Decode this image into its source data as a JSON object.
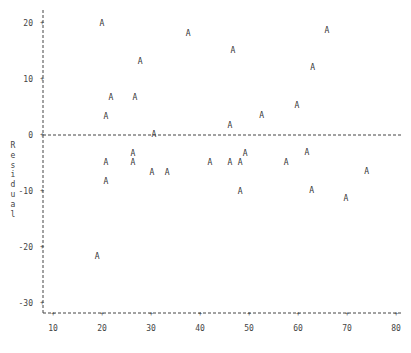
{
  "chart_data": {
    "type": "scatter",
    "title": "",
    "xlabel": "",
    "ylabel": "Residual",
    "xlim": [
      10,
      80
    ],
    "ylim": [
      -30,
      20
    ],
    "x_ticks": [
      10,
      20,
      30,
      40,
      50,
      60,
      70,
      80
    ],
    "y_ticks": [
      20,
      10,
      0,
      -10,
      -20,
      -30
    ],
    "grid": false,
    "reference_line": {
      "y": 0,
      "style": "dashed"
    },
    "marker": "A",
    "series": [
      {
        "name": "A",
        "points": [
          {
            "x": 20.0,
            "y": 20.0
          },
          {
            "x": 27.8,
            "y": 13.2
          },
          {
            "x": 37.6,
            "y": 18.2
          },
          {
            "x": 46.7,
            "y": 15.2
          },
          {
            "x": 65.9,
            "y": 18.8
          },
          {
            "x": 63.0,
            "y": 12.1
          },
          {
            "x": 21.8,
            "y": 6.8
          },
          {
            "x": 26.7,
            "y": 6.8
          },
          {
            "x": 20.8,
            "y": 3.4
          },
          {
            "x": 46.1,
            "y": 1.8
          },
          {
            "x": 52.6,
            "y": 3.6
          },
          {
            "x": 59.8,
            "y": 5.4
          },
          {
            "x": 30.6,
            "y": 0.2
          },
          {
            "x": 26.3,
            "y": -3.2
          },
          {
            "x": 20.8,
            "y": -4.8
          },
          {
            "x": 26.3,
            "y": -4.8
          },
          {
            "x": 30.2,
            "y": -6.6
          },
          {
            "x": 33.3,
            "y": -6.6
          },
          {
            "x": 42.0,
            "y": -4.8
          },
          {
            "x": 46.1,
            "y": -4.8
          },
          {
            "x": 48.2,
            "y": -4.8
          },
          {
            "x": 49.2,
            "y": -3.2
          },
          {
            "x": 48.2,
            "y": -10.0
          },
          {
            "x": 57.6,
            "y": -4.8
          },
          {
            "x": 61.8,
            "y": -3.0
          },
          {
            "x": 62.8,
            "y": -9.8
          },
          {
            "x": 74.0,
            "y": -6.4
          },
          {
            "x": 69.8,
            "y": -11.3
          },
          {
            "x": 20.8,
            "y": -8.2
          },
          {
            "x": 19.0,
            "y": -21.6
          }
        ]
      }
    ]
  },
  "axis": {
    "ylabel_chars": [
      "R",
      "e",
      "s",
      "i",
      "d",
      "u",
      "a",
      "l"
    ]
  },
  "colors": {
    "axis": "#444444",
    "marker": "#333333",
    "background": "#ffffff"
  }
}
